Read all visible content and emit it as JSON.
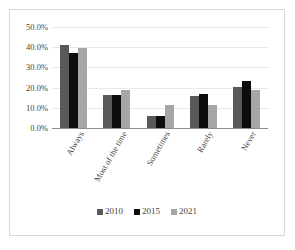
{
  "chart_data": {
    "type": "bar",
    "title": "",
    "xlabel": "",
    "ylabel": "",
    "categories": [
      "Always",
      "Most of the time",
      "Sometimes",
      "Rarely",
      "Never"
    ],
    "series": [
      {
        "name": "2010",
        "color": "#595959",
        "values": [
          41.0,
          16.5,
          6.0,
          16.0,
          20.5
        ]
      },
      {
        "name": "2015",
        "color": "#0d0d0d",
        "values": [
          37.0,
          16.5,
          6.0,
          17.0,
          23.5
        ]
      },
      {
        "name": "2021",
        "color": "#a6a6a6",
        "values": [
          39.5,
          19.0,
          11.5,
          11.5,
          19.0
        ]
      }
    ],
    "ylim": [
      0.0,
      50.0
    ],
    "y_ticks": [
      "0.0%",
      "10.0%",
      "20.0%",
      "30.0%",
      "40.0%",
      "50.0%"
    ],
    "y_tick_values": [
      0.0,
      10.0,
      20.0,
      30.0,
      40.0,
      50.0
    ],
    "grid": true,
    "grid_axis": "y",
    "legend_position": "bottom",
    "x_tick_rotation": -60
  }
}
